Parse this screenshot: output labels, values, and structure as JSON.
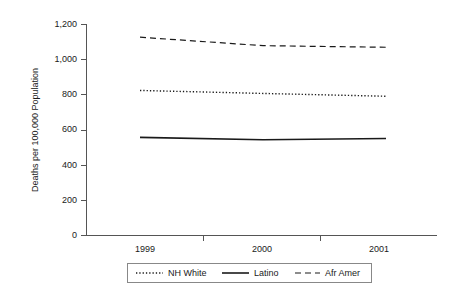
{
  "chart_data": {
    "type": "line",
    "title": "",
    "xlabel": "",
    "ylabel": "Deaths per 100,000 Population",
    "categories": [
      "1999",
      "2000",
      "2001"
    ],
    "ylim": [
      0,
      1200
    ],
    "ytick_labels": [
      "0",
      "200",
      "400",
      "600",
      "800",
      "1,000",
      "1,200"
    ],
    "ytick_values": [
      0,
      200,
      400,
      600,
      800,
      1000,
      1200
    ],
    "grid": false,
    "legend_position": "bottom",
    "series": [
      {
        "name": "NH White",
        "style": "dotted",
        "color": "#1a1a1a",
        "values": [
          823,
          806,
          790
        ]
      },
      {
        "name": "Latino",
        "style": "solid",
        "color": "#1a1a1a",
        "values": [
          557,
          543,
          550
        ]
      },
      {
        "name": "Afr Amer",
        "style": "dashed",
        "color": "#1a1a1a",
        "values": [
          1125,
          1077,
          1068
        ]
      }
    ]
  },
  "legend": {
    "entries": [
      {
        "label": "NH White",
        "style": "dotted"
      },
      {
        "label": "Latino",
        "style": "solid"
      },
      {
        "label": "Afr Amer",
        "style": "dashed"
      }
    ]
  },
  "axis": {
    "y_title": "Deaths per 100,000 Population",
    "y_labels": [
      "1,200",
      "1,000",
      "800",
      "600",
      "400",
      "200",
      "0"
    ],
    "x_labels": [
      "1999",
      "2000",
      "2001"
    ]
  },
  "colors": {
    "line": "#1a1a1a",
    "axis": "#555555",
    "legend_border": "#888888",
    "background": "#ffffff"
  }
}
